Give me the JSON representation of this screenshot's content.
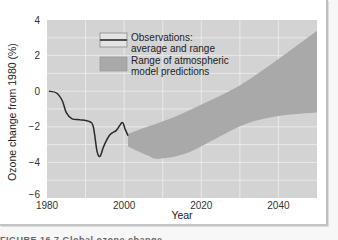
{
  "chart_data": {
    "type": "line",
    "title": "",
    "xlabel": "Year",
    "ylabel": "Ozone change from 1980 (%)",
    "xlim": [
      1980,
      2050
    ],
    "ylim": [
      -6,
      4
    ],
    "x_ticks": [
      1980,
      2000,
      2020,
      2040
    ],
    "x_tick_labels": [
      "1980",
      "2000",
      "2020",
      "2040"
    ],
    "y_ticks": [
      4,
      2,
      0,
      -2,
      -4,
      -6
    ],
    "y_tick_labels": [
      "4",
      "2",
      "0",
      "−2",
      "−4",
      "−6"
    ],
    "grid": {
      "on": true,
      "x_step": 10,
      "y_step": 1
    },
    "legend": {
      "position": "upper-left-inside",
      "entries": [
        {
          "label_line1": "Observations:",
          "label_line2": "average and range",
          "kind": "line"
        },
        {
          "label_line1": "Range of atmospheric",
          "label_line2": "model predictions",
          "kind": "area"
        }
      ]
    },
    "series": [
      {
        "name": "Observations: average and range",
        "type": "line",
        "x": [
          1980.5,
          1982.5,
          1984,
          1985,
          1986.5,
          1988.5,
          1991,
          1992,
          1993,
          1993.8,
          1994.7,
          1996.3,
          1998,
          1999.5,
          2000.2,
          2001
        ],
        "values": [
          0,
          -0.1,
          -0.55,
          -1.2,
          -1.55,
          -1.6,
          -1.7,
          -2.0,
          -3.4,
          -3.65,
          -3.1,
          -2.45,
          -2.2,
          -1.75,
          -2.1,
          -2.5
        ]
      },
      {
        "name": "Range of atmospheric model predictions",
        "type": "area",
        "upper": {
          "x": [
            2001,
            2006,
            2013,
            2020.5,
            2029,
            2038,
            2050
          ],
          "values": [
            -2.4,
            -2.0,
            -1.45,
            -0.7,
            0.2,
            1.5,
            3.4
          ]
        },
        "lower": {
          "x": [
            2001,
            2006,
            2009,
            2016,
            2023,
            2031.5,
            2040,
            2050
          ],
          "values": [
            -3.1,
            -3.6,
            -3.8,
            -3.5,
            -2.75,
            -1.85,
            -1.4,
            -1.2
          ]
        }
      }
    ],
    "colors": {
      "plot_bg": "#d3d3d3",
      "grid": "#e9e9e9",
      "band": "#a9a9a9",
      "line": "#2a2a2a",
      "legend_line_box": "#e4e4e4"
    }
  },
  "caption": {
    "text": "FIGURE 16.7 Global ozone change..."
  }
}
